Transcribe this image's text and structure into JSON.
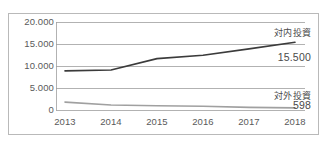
{
  "chart_data": {
    "type": "line",
    "title": "",
    "subtitle": "",
    "xlabel": "",
    "ylabel": "",
    "categories": [
      "2013",
      "2014",
      "2015",
      "2016",
      "2017",
      "2018"
    ],
    "ylim": [
      0,
      20000
    ],
    "yticks": [
      "0",
      "5.000",
      "10.000",
      "15.000",
      "20.000"
    ],
    "ytick_values": [
      0,
      5000,
      10000,
      15000,
      20000
    ],
    "grid": true,
    "legend_position": "right-inline",
    "series": [
      {
        "name": "対内投資",
        "color": "#3b3b3b",
        "values": [
          9000,
          9200,
          11800,
          12550,
          14000,
          15500
        ],
        "end_label": "対内投資",
        "end_value": "15.500"
      },
      {
        "name": "対外投資",
        "color": "#a0a0a0",
        "values": [
          1900,
          1250,
          1100,
          950,
          700,
          598
        ],
        "end_label": "対外投資",
        "end_value": "598"
      }
    ]
  },
  "axis": {
    "y_labels": [
      {
        "text": "20.000",
        "value": 20000
      },
      {
        "text": "15.000",
        "value": 15000
      },
      {
        "text": "10.000",
        "value": 10000
      },
      {
        "text": "5.000",
        "value": 5000
      },
      {
        "text": "0",
        "value": 0
      }
    ],
    "x_labels": [
      "2013",
      "2014",
      "2015",
      "2016",
      "2017",
      "2018"
    ]
  },
  "annotations": {
    "inbound_label": "対内投資",
    "inbound_value": "15.500",
    "outbound_label": "対外投資",
    "outbound_value": "598"
  },
  "colors": {
    "inbound_line": "#3b3b3b",
    "outbound_line": "#a0a0a0",
    "gridline": "#9e9e9e",
    "frame": "#b9b9b9",
    "text": "#5a5a5a",
    "background": "#ffffff"
  }
}
